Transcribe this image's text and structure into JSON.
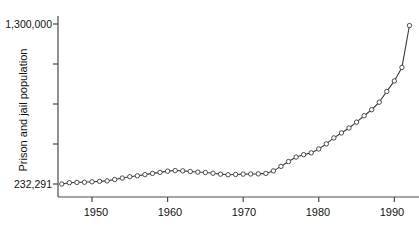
{
  "chart_data": {
    "type": "line",
    "title": "",
    "xlabel": "",
    "ylabel": "Prison and jail population",
    "x_tick_labels": [
      "1950",
      "1960",
      "1970",
      "1980",
      "1990"
    ],
    "x_ticks": [
      1950,
      1960,
      1970,
      1980,
      1990
    ],
    "y_tick_labels": [
      "232,291",
      "",
      "",
      "",
      "1,300,000"
    ],
    "y_ticks": [
      232291,
      499218,
      766145,
      1033072,
      1300000
    ],
    "xlim": [
      1945.5,
      1992.6
    ],
    "ylim": [
      232291,
      1300000
    ],
    "grid": false,
    "legend": false,
    "marker": "open-circle",
    "line_color": "#3a3a3a",
    "marker_face_color": "#ffffff",
    "marker_edge_color": "#3a3a3a",
    "x": [
      1946,
      1947,
      1948,
      1949,
      1950,
      1951,
      1952,
      1953,
      1954,
      1955,
      1956,
      1957,
      1958,
      1959,
      1960,
      1961,
      1962,
      1963,
      1964,
      1965,
      1966,
      1967,
      1968,
      1969,
      1970,
      1971,
      1972,
      1973,
      1974,
      1975,
      1976,
      1977,
      1978,
      1979,
      1980,
      1981,
      1982,
      1983,
      1984,
      1985,
      1986,
      1987,
      1988,
      1989,
      1990,
      1991,
      1992
    ],
    "values": [
      232291,
      241000,
      243000,
      244000,
      247000,
      250000,
      253000,
      262000,
      272000,
      281000,
      287000,
      295000,
      303000,
      310000,
      318000,
      322000,
      320000,
      316000,
      312000,
      309000,
      304000,
      298000,
      294000,
      296000,
      298000,
      299000,
      300000,
      303000,
      320000,
      350000,
      382000,
      412000,
      428000,
      440000,
      466000,
      500000,
      540000,
      573000,
      606000,
      645000,
      688000,
      728000,
      778000,
      850000,
      920000,
      1010000,
      1290000
    ]
  },
  "axes": {
    "y_axis_name": "prison-and-jail-population-axis",
    "x_axis_name": "year-axis"
  }
}
